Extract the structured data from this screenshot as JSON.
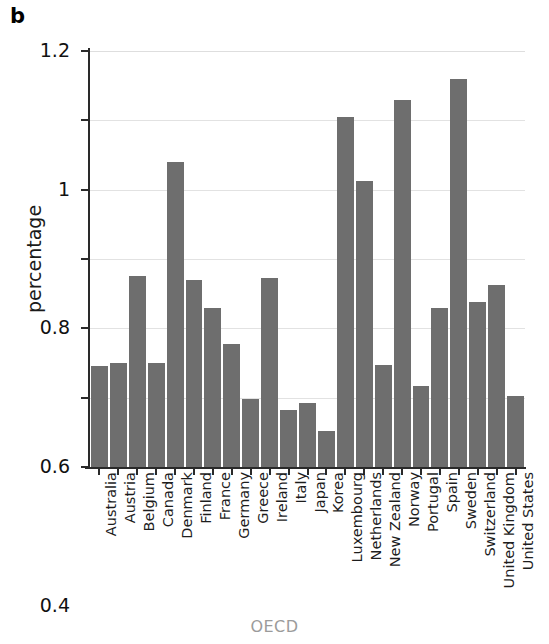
{
  "figure": {
    "panel_letter": "b",
    "ylabel": "percentage",
    "xlabel": "OECD",
    "bar_color": "#6e6e6e",
    "grid_color": "#e2e2e2",
    "axis_color": "#2a2a2a",
    "xlabel_color": "#9b9b9b"
  },
  "chart_data": {
    "type": "bar",
    "title": "",
    "subtitle": "",
    "xlabel": "OECD",
    "ylabel": "percentage",
    "ylim": [
      0,
      1.2
    ],
    "yticks": [
      0,
      0.2,
      0.4,
      0.6,
      0.8,
      1,
      1.2
    ],
    "ytick_labels": [
      "0",
      "0.2",
      "0.4",
      "0.6",
      "0.8",
      "1",
      "1.2"
    ],
    "grid": true,
    "legend": null,
    "legend_position": "none",
    "categories": [
      "Australia",
      "Austria",
      "Belgium",
      "Canada",
      "Denmark",
      "Finland",
      "France",
      "Germany",
      "Greece",
      "Ireland",
      "Italy",
      "Japan",
      "Korea",
      "Luxembourg",
      "Netherlands",
      "New Zealand",
      "Norway",
      "Portugal",
      "Spain",
      "Sweden",
      "Switzerland",
      "United Kingdom",
      "United States"
    ],
    "values": [
      0.29,
      0.3,
      0.55,
      0.3,
      0.88,
      0.54,
      0.46,
      0.355,
      0.195,
      0.545,
      0.165,
      0.185,
      0.105,
      1.01,
      0.825,
      0.295,
      1.06,
      0.235,
      0.46,
      1.12,
      0.475,
      0.525,
      0.205
    ]
  }
}
